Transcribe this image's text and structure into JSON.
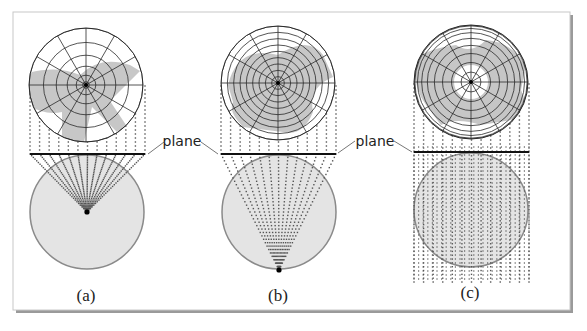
{
  "figure": {
    "width": 587,
    "height": 331,
    "frame": {
      "x": 13,
      "y": 12,
      "w": 558,
      "h": 299,
      "border": "#bdbdbd",
      "shadow": "#9a9a9a"
    },
    "colors": {
      "grid_line": "#2a2a2a",
      "land_gray": "#bdbdbd",
      "globe_fill": "#e4e4e4",
      "globe_stroke": "#8a8a8a",
      "dot": "#555555",
      "plane_line": "#111111",
      "leader": "#777777"
    },
    "plane_label": "plane",
    "panels": [
      {
        "id": "a",
        "caption": "(a)",
        "projection": "gnomonic",
        "map": {
          "cx": 86,
          "cy": 85,
          "r": 57,
          "rings": 6,
          "spokes": 12,
          "ring_style": "gnomonic"
        },
        "plane": {
          "x1": 30,
          "x2": 145,
          "y": 154
        },
        "globe": {
          "cx": 87,
          "cy": 212,
          "r": 57
        },
        "focus": {
          "x": 87,
          "y": 212
        },
        "caption_pos": {
          "x": 86,
          "y": 301
        }
      },
      {
        "id": "b",
        "caption": "(b)",
        "projection": "stereographic",
        "map": {
          "cx": 278,
          "cy": 83,
          "r": 57,
          "rings": 9,
          "spokes": 12,
          "ring_style": "stereographic"
        },
        "plane": {
          "x1": 221,
          "x2": 336,
          "y": 154
        },
        "globe": {
          "cx": 279,
          "cy": 212,
          "r": 57
        },
        "focus": {
          "x": 279,
          "y": 270
        },
        "caption_pos": {
          "x": 278,
          "y": 301
        }
      },
      {
        "id": "c",
        "caption": "(c)",
        "projection": "orthographic",
        "map": {
          "cx": 471,
          "cy": 82,
          "r": 57,
          "rings": 9,
          "spokes": 12,
          "ring_style": "orthographic"
        },
        "plane": {
          "x1": 414,
          "x2": 529,
          "y": 152
        },
        "globe": {
          "cx": 471,
          "cy": 210,
          "r": 57
        },
        "focus": null,
        "caption_pos": {
          "x": 470,
          "y": 298
        }
      }
    ],
    "labels": [
      {
        "text": "plane",
        "x": 182,
        "y": 146,
        "leaders": [
          [
            148,
            154,
            164,
            142
          ],
          [
            201,
            142,
            218,
            154
          ]
        ]
      },
      {
        "text": "plane",
        "x": 375,
        "y": 146,
        "leaders": [
          [
            338,
            153,
            355,
            141
          ],
          [
            394,
            141,
            412,
            152
          ]
        ]
      }
    ]
  }
}
